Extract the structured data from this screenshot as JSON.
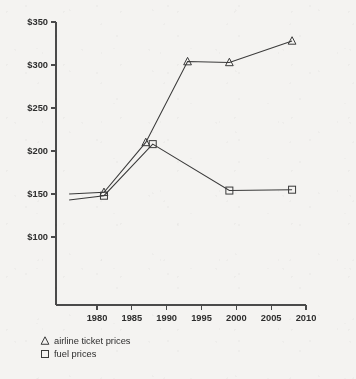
{
  "chart_data": {
    "type": "line",
    "title": "",
    "subtitle": "",
    "xlabel": "",
    "ylabel": "",
    "xlim": [
      1976,
      2010
    ],
    "ylim": [
      75,
      350
    ],
    "grid": false,
    "legend_position": "below-left",
    "y_ticks": [
      100,
      150,
      200,
      250,
      300,
      350
    ],
    "y_tick_labels": [
      "$100",
      "$150",
      "$200",
      "$250",
      "$300",
      "$350"
    ],
    "x_ticks": [
      1980,
      1985,
      1990,
      1995,
      2000,
      2005,
      2010
    ],
    "x_tick_labels": [
      "1980",
      "1985",
      "1990",
      "1995",
      "2000",
      "2005",
      "2010"
    ],
    "series": [
      {
        "name": "airline ticket prices",
        "marker": "triangle",
        "x": [
          1976,
          1981,
          1987,
          1993,
          1999,
          2008
        ],
        "values": [
          150,
          152,
          210,
          304,
          303,
          328
        ],
        "point_labels": [
          "$150",
          "$152",
          "$210",
          "$304",
          "$303",
          "$328"
        ]
      },
      {
        "name": "fuel prices",
        "marker": "square",
        "x": [
          1976,
          1981,
          1988,
          1999,
          2008
        ],
        "values": [
          143,
          148,
          208,
          154,
          155
        ],
        "point_labels": [
          "$143",
          "$148",
          "$208",
          "$154",
          "$155"
        ]
      }
    ]
  },
  "legend": {
    "entries": [
      {
        "marker_symbol": "triangle",
        "label": "airline ticket prices"
      },
      {
        "marker_symbol": "square",
        "label": "fuel prices"
      }
    ]
  },
  "colors": {
    "background": "#f4f3f1",
    "ink": "#3a3a3a",
    "axis": "#4a4a4a",
    "text": "#2e2e2e"
  }
}
